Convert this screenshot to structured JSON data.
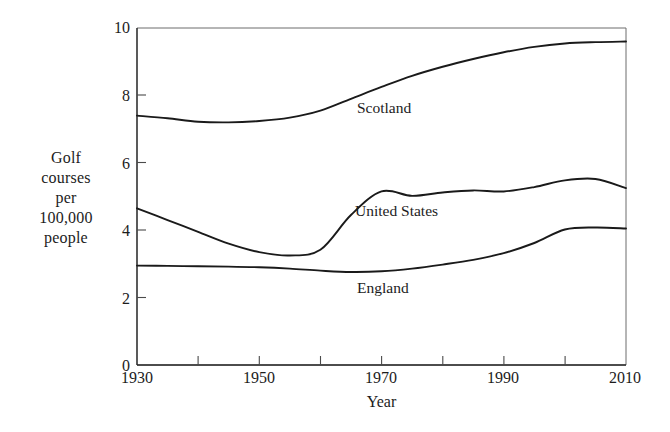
{
  "chart_data": {
    "type": "line",
    "title": "",
    "xlabel": "Year",
    "ylabel": "Golf courses per 100,000 people",
    "ylabel_lines": [
      "Golf",
      "courses",
      "per",
      "100,000",
      "people"
    ],
    "xlim": [
      1930,
      2010
    ],
    "ylim": [
      0,
      10
    ],
    "grid": false,
    "legend_position": "inline-annotations",
    "x_ticks_major": [
      1930,
      1950,
      1970,
      1990,
      2010
    ],
    "x_ticks_minor": [
      1940,
      1960,
      1980,
      2000
    ],
    "x_tick_labels": [
      "1930",
      "1950",
      "1970",
      "1990",
      "2010"
    ],
    "y_ticks": [
      0,
      2,
      4,
      6,
      8,
      10
    ],
    "y_tick_labels": [
      "0",
      "2",
      "4",
      "6",
      "8",
      "10"
    ],
    "line_color": "#1a1a1a",
    "series": [
      {
        "name": "Scotland",
        "label": "Scotland",
        "x": [
          1930,
          1935,
          1940,
          1945,
          1950,
          1955,
          1960,
          1965,
          1970,
          1975,
          1980,
          1985,
          1990,
          1995,
          2000,
          2005,
          2010
        ],
        "values": [
          7.4,
          7.32,
          7.22,
          7.2,
          7.24,
          7.34,
          7.55,
          7.9,
          8.25,
          8.58,
          8.85,
          9.08,
          9.28,
          9.44,
          9.54,
          9.58,
          9.6
        ]
      },
      {
        "name": "United States",
        "label": "United States",
        "x": [
          1930,
          1935,
          1940,
          1945,
          1950,
          1955,
          1960,
          1965,
          1970,
          1975,
          1980,
          1985,
          1990,
          1995,
          2000,
          2005,
          2010
        ],
        "values": [
          4.65,
          4.3,
          3.95,
          3.6,
          3.35,
          3.25,
          3.42,
          4.45,
          5.15,
          5.02,
          5.12,
          5.18,
          5.15,
          5.28,
          5.48,
          5.52,
          5.25
        ]
      },
      {
        "name": "England",
        "label": "England",
        "x": [
          1930,
          1935,
          1940,
          1945,
          1950,
          1955,
          1960,
          1965,
          1970,
          1975,
          1980,
          1985,
          1990,
          1995,
          2000,
          2005,
          2010
        ],
        "values": [
          2.95,
          2.94,
          2.93,
          2.92,
          2.9,
          2.86,
          2.8,
          2.76,
          2.78,
          2.86,
          2.98,
          3.12,
          3.32,
          3.62,
          4.02,
          4.08,
          4.05
        ]
      }
    ]
  }
}
